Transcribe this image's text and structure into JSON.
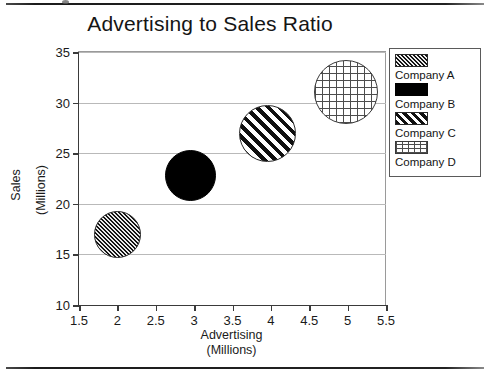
{
  "chart_data": {
    "type": "scatter",
    "title": "Advertising to Sales Ratio",
    "xlabel": "Advertising",
    "xlabel_sub": "(Millions)",
    "ylabel": "Sales",
    "ylabel_sub": "(Millions)",
    "xlim": [
      1.5,
      5.5
    ],
    "ylim": [
      10,
      35
    ],
    "xticks": [
      "1.5",
      "2",
      "2.5",
      "3",
      "3.5",
      "4",
      "4.5",
      "5",
      "5.5"
    ],
    "xtick_values": [
      1.5,
      2,
      2.5,
      3,
      3.5,
      4,
      4.5,
      5,
      5.5
    ],
    "yticks": [
      "10",
      "15",
      "20",
      "25",
      "30",
      "35"
    ],
    "ytick_values": [
      10,
      15,
      20,
      25,
      30,
      35
    ],
    "grid": "horizontal",
    "legend_position": "right",
    "points": [
      {
        "name": "Company A",
        "x": 2.0,
        "y": 17.0,
        "size_px": 47,
        "pattern": "dense-diagonal-hatch-gray"
      },
      {
        "name": "Company B",
        "x": 2.95,
        "y": 22.8,
        "size_px": 51,
        "pattern": "solid-black"
      },
      {
        "name": "Company C",
        "x": 3.95,
        "y": 26.9,
        "size_px": 57,
        "pattern": "wide-diagonal-stripes"
      },
      {
        "name": "Company D",
        "x": 4.98,
        "y": 31.0,
        "size_px": 64,
        "pattern": "crosshatch-grid"
      }
    ],
    "series": [
      {
        "name": "Company A",
        "values": [
          17.0
        ]
      },
      {
        "name": "Company B",
        "values": [
          22.8
        ]
      },
      {
        "name": "Company C",
        "values": [
          26.9
        ]
      },
      {
        "name": "Company D",
        "values": [
          31.0
        ]
      }
    ]
  },
  "legend": {
    "items": [
      {
        "label": "Company A",
        "pattern": "dense-diagonal-hatch-gray"
      },
      {
        "label": "Company B",
        "pattern": "solid-black"
      },
      {
        "label": "Company C",
        "pattern": "wide-diagonal-stripes"
      },
      {
        "label": "Company D",
        "pattern": "crosshatch-grid"
      }
    ]
  },
  "colors": {
    "axis": "#3a3a3a",
    "gridline": "#b9b9b9",
    "text": "#151515",
    "legend_border": "#5a5a5a",
    "page_rule": "#1c1c1c"
  }
}
